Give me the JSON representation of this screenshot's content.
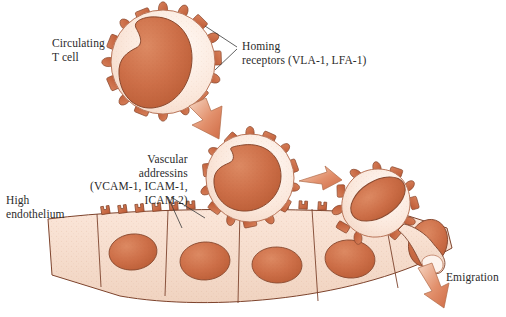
{
  "figure": {
    "domain": "biology-diagram"
  },
  "labels": {
    "circulating_t_cell": "Circulating\nT cell",
    "homing_receptors": "Homing\nreceptors (VLA-1, LFA-1)",
    "vascular_addressins": "Vascular\naddressins\n(VCAM-1, ICAM-1,\n        ICAM 2)",
    "high_endothelium": "High\nendothelium",
    "emigration": "Emigration"
  },
  "colors": {
    "nucleus": "#cc6f48",
    "nucleus_dark": "#b85a35",
    "cytoplasm": "#fbe8dc",
    "endothelium_body": "#f6ded0",
    "receptor": "#c35f3a",
    "receptor_light": "#d98a68",
    "outline": "#8a4a30",
    "arrow_fill": "#e2906c",
    "arrow_light": "#f3cdb8",
    "leader_line": "#3a3a3a",
    "text": "#2b2b2b"
  },
  "cells": {
    "circulating": {
      "cx": 163,
      "cy": 62,
      "r": 52,
      "receptor_count": 16
    },
    "rolling": {
      "cx": 250,
      "cy": 180,
      "r": 44,
      "receptor_count": 15
    },
    "adhering": {
      "cx": 377,
      "cy": 205,
      "r": 38,
      "receptor_count": 12
    }
  },
  "endothelium": {
    "cell_count": 6,
    "addressin_count": 12,
    "nuclei": 5
  },
  "arrows": [
    {
      "name": "arrow-to-rolling",
      "direction": "down-right"
    },
    {
      "name": "arrow-to-adhering",
      "direction": "right"
    },
    {
      "name": "arrow-emigration",
      "direction": "down-right"
    }
  ]
}
